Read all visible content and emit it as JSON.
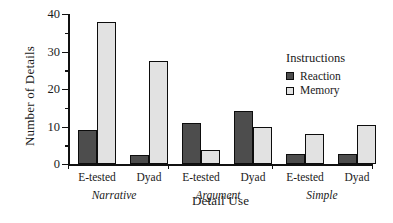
{
  "chart_data": {
    "type": "bar",
    "title": "",
    "xlabel": "Detail Use",
    "ylabel": "Number of Details",
    "ylim": [
      0,
      40
    ],
    "yticks_major": [
      0,
      10,
      20,
      30,
      40
    ],
    "yticks_minor": [
      5,
      15,
      25,
      35
    ],
    "grid": false,
    "legend_position": "right",
    "legend_title": "Instructions",
    "groups": [
      "Narrative",
      "Argument",
      "Simple"
    ],
    "categories": [
      "E-tested",
      "Dyad",
      "E-tested",
      "Dyad",
      "E-tested",
      "Dyad"
    ],
    "series": [
      {
        "name": "Reaction",
        "color": "#4d4d4d",
        "values": [
          9,
          2.5,
          11,
          14.2,
          2.8,
          2.8
        ]
      },
      {
        "name": "Memory",
        "color": "#e2e2e2",
        "values": [
          37.8,
          27.4,
          3.8,
          9.8,
          8.1,
          10.3
        ]
      }
    ],
    "points": [
      {
        "group": "Narrative",
        "category": "E-tested",
        "series": "Reaction",
        "value": 9
      },
      {
        "group": "Narrative",
        "category": "E-tested",
        "series": "Memory",
        "value": 37.8
      },
      {
        "group": "Narrative",
        "category": "Dyad",
        "series": "Reaction",
        "value": 2.5
      },
      {
        "group": "Narrative",
        "category": "Dyad",
        "series": "Memory",
        "value": 27.4
      },
      {
        "group": "Argument",
        "category": "E-tested",
        "series": "Reaction",
        "value": 11
      },
      {
        "group": "Argument",
        "category": "E-tested",
        "series": "Memory",
        "value": 3.8
      },
      {
        "group": "Argument",
        "category": "Dyad",
        "series": "Reaction",
        "value": 14.2
      },
      {
        "group": "Argument",
        "category": "Dyad",
        "series": "Memory",
        "value": 9.8
      },
      {
        "group": "Simple",
        "category": "E-tested",
        "series": "Reaction",
        "value": 2.8
      },
      {
        "group": "Simple",
        "category": "E-tested",
        "series": "Memory",
        "value": 8.1
      },
      {
        "group": "Simple",
        "category": "Dyad",
        "series": "Reaction",
        "value": 2.8
      },
      {
        "group": "Simple",
        "category": "Dyad",
        "series": "Memory",
        "value": 10.3
      }
    ]
  }
}
